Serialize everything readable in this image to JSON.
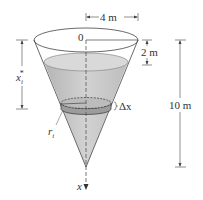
{
  "figure": {
    "shape": "inverted right circular cone tank partially filled with water",
    "labels": {
      "top_radius": "4 m",
      "origin": "0",
      "empty_depth": "2 m",
      "total_height": "10 m",
      "depth_variable": "x",
      "depth_sub": "i",
      "depth_star": "*",
      "slab_radius": "r",
      "slab_radius_sub": "i",
      "slab_thickness": "Δx",
      "axis_label": "x"
    },
    "colors": {
      "water": "#c8c8c8",
      "water_dark": "#a9a9a9",
      "outline": "#444444",
      "slab": "#9a9a9a"
    }
  }
}
